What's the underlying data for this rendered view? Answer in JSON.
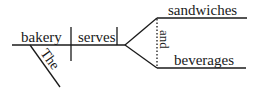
{
  "diagram": {
    "type": "sentence-diagram",
    "subject": "bakery",
    "subject_modifier": "The",
    "verb": "serves",
    "conjunction": "and",
    "objects": [
      "sandwiches",
      "beverages"
    ],
    "line_color": "#1a1a1a"
  }
}
